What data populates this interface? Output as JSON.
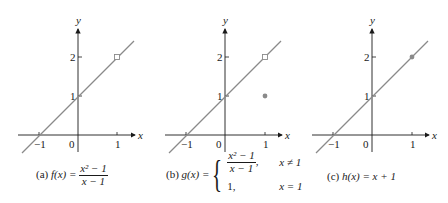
{
  "colors": {
    "curve": "#8a8a8a",
    "axis": "#1a1a1a",
    "point": "#8a8a8a"
  },
  "panels": [
    {
      "id": "a",
      "caption_prefix": "(a)",
      "func_name": "f(x) =",
      "numerator": "x² − 1",
      "denominator": "x − 1",
      "axis_x": "x",
      "axis_y": "y",
      "ticks_x": [
        "−1",
        "0",
        "1"
      ],
      "ticks_y": [
        "1",
        "2"
      ],
      "open_point": [
        1,
        2
      ],
      "filled_point": null
    },
    {
      "id": "b",
      "caption_prefix": "(b)",
      "func_name": "g(x) =",
      "case1_numerator": "x² − 1",
      "case1_denominator": "x − 1",
      "case1_condition": "x ≠ 1",
      "case2_value": "1,",
      "case2_condition": "x = 1",
      "axis_x": "x",
      "axis_y": "y",
      "ticks_x": [
        "−1",
        "0",
        "1"
      ],
      "ticks_y": [
        "1",
        "2"
      ],
      "open_point": [
        1,
        2
      ],
      "filled_point": [
        1,
        1
      ]
    },
    {
      "id": "c",
      "caption_prefix": "(c)",
      "func_name": "h(x) = x + 1",
      "axis_x": "x",
      "axis_y": "y",
      "ticks_x": [
        "−1",
        "0",
        "1"
      ],
      "ticks_y": [
        "1",
        "2"
      ],
      "open_point": null,
      "filled_point": [
        1,
        2
      ]
    }
  ]
}
